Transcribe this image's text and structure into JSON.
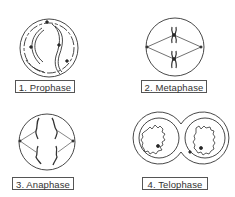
{
  "stages": [
    {
      "number": "1.",
      "name": "Prophase",
      "label": "1. Prophase"
    },
    {
      "number": "2.",
      "name": "Metaphase",
      "label": "2. Metaphase"
    },
    {
      "number": "3.",
      "name": "Anaphase",
      "label": "3. Anaphase"
    },
    {
      "number": "4.",
      "name": "Telophase",
      "label": "4. Telophase"
    }
  ],
  "colors": {
    "line": "#333333",
    "label_border": "#555555",
    "background": "#ffffff"
  }
}
